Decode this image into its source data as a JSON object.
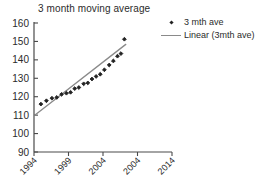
{
  "chart_data": {
    "type": "scatter",
    "title": "3 month moving average",
    "xlabel": "",
    "ylabel": "",
    "xlim": [
      1994,
      2014
    ],
    "ylim": [
      90,
      160
    ],
    "grid": false,
    "legend_position": "top-right",
    "xticks": [
      "1994",
      "1999",
      "2004",
      "2004",
      "2014"
    ],
    "xtick_values": [
      1994,
      1999,
      2004,
      2009,
      2014
    ],
    "yticks": [
      "90",
      "100",
      "110",
      "120",
      "130",
      "140",
      "150",
      "160"
    ],
    "ytick_values": [
      90,
      100,
      110,
      120,
      130,
      140,
      150,
      160
    ],
    "series": [
      {
        "name": "3 mth ave",
        "type": "scatter",
        "marker": "diamond",
        "color": "#222222",
        "x": [
          1995.0,
          1995.8,
          1996.6,
          1997.3,
          1998.0,
          1998.7,
          1999.3,
          1999.9,
          2000.5,
          2001.2,
          2001.8,
          2002.4,
          2003.0,
          2003.6,
          2004.2,
          2004.9,
          2005.5,
          2006.1,
          2006.6,
          2007.1
        ],
        "y": [
          116.0,
          117.8,
          119.2,
          119.6,
          121.3,
          121.9,
          122.4,
          124.4,
          125.0,
          127.0,
          127.5,
          129.6,
          131.0,
          132.2,
          134.6,
          137.2,
          139.4,
          142.0,
          143.4,
          151.2
        ]
      },
      {
        "name": "Linear (3mth ave)",
        "type": "line",
        "color": "#8a8a8a",
        "x": [
          1994.1,
          2007.3
        ],
        "y": [
          110.0,
          148.4
        ]
      }
    ],
    "legend": [
      {
        "label": "3 mth ave",
        "key": "diamond-marker",
        "color": "#222222"
      },
      {
        "label": "Linear (3mth ave)",
        "key": "line-swatch",
        "color": "#8a8a8a"
      }
    ]
  },
  "axes": {
    "axis_color": "#4a4a4a"
  }
}
